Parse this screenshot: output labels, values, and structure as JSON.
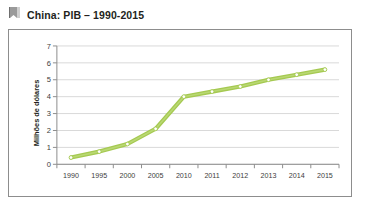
{
  "header": {
    "title": "China: PIB – 1990-2015",
    "icon": "bookmark-flag-icon"
  },
  "credit": {
    "text": "ADILSON BROCCO"
  },
  "colors": {
    "line": "#a4c council",
    "line_hex": "#a5c951",
    "line_light": "#b9d873",
    "marker_fill": "#ffffff",
    "grid": "#d9d9d9",
    "axis": "#8d8d8d",
    "frame": "#8d8d8d",
    "text": "#231f20"
  },
  "chart_data": {
    "type": "line",
    "title": "China: PIB – 1990-2015",
    "xlabel": "",
    "ylabel": "Milhões de dólares",
    "categories": [
      "1990",
      "1995",
      "2000",
      "2005",
      "2010",
      "2011",
      "2012",
      "2013",
      "2014",
      "2015"
    ],
    "values": [
      0.4,
      0.75,
      1.2,
      2.1,
      4.0,
      4.3,
      4.6,
      5.0,
      5.3,
      5.6
    ],
    "ylim": [
      0,
      7
    ],
    "yticks": [
      0,
      1,
      2,
      3,
      4,
      5,
      6,
      7
    ],
    "ytick_labels": [
      "0",
      "1",
      "2",
      "3",
      "4",
      "5",
      "6",
      "7"
    ],
    "grid": true,
    "grid_axis": "y",
    "legend": false,
    "markers": "circle"
  }
}
